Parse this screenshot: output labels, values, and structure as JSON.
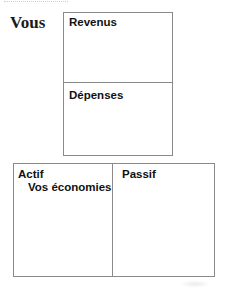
{
  "header": {
    "title": "Vous"
  },
  "top_panel": {
    "sections": [
      {
        "label": "Revenus"
      },
      {
        "label": "Dépenses"
      }
    ]
  },
  "bottom_panel": {
    "columns": [
      {
        "label": "Actif",
        "items": [
          "Vos économies"
        ]
      },
      {
        "label": "Passif",
        "items": []
      }
    ]
  },
  "colors": {
    "border": "#8a8a8a",
    "text": "#111111",
    "background": "#ffffff"
  }
}
